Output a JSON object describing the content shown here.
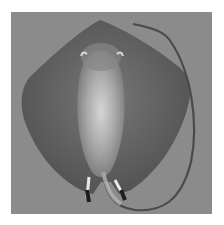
{
  "image": {
    "subject": "stingray, ventral view",
    "colors": {
      "background": "#8a8a8a",
      "body_dark": "#5a5a5a",
      "body_mid": "#6e6e6e",
      "belly_light": "#cfcfcf",
      "tail": "#4a4a4a",
      "claspers": "#2a2a2a"
    }
  }
}
